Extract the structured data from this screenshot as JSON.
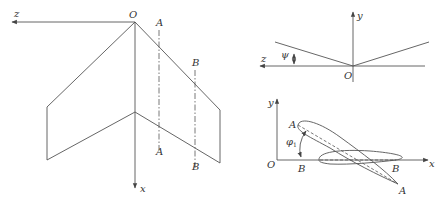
{
  "figure": {
    "left_panel": {
      "description": "Planform of swept wing (top view)",
      "labels": {
        "origin": "O",
        "axis_z": "z",
        "axis_x": "x",
        "section_a_top": "A",
        "section_a_bottom": "A",
        "section_b_top": "B",
        "section_b_bottom": "B"
      }
    },
    "top_right_panel": {
      "description": "Front view showing dihedral angle",
      "labels": {
        "axis_y": "y",
        "axis_z": "z",
        "origin": "O",
        "angle": "ψ"
      }
    },
    "bottom_right_panel": {
      "description": "Airfoil sections A-A and B-B showing twist angle",
      "labels": {
        "axis_y": "y",
        "axis_x": "x",
        "origin": "O",
        "leading_a": "A",
        "trailing_a": "A",
        "leading_b": "B",
        "trailing_b": "B",
        "angle": "φ",
        "angle_sub": "1"
      }
    }
  }
}
